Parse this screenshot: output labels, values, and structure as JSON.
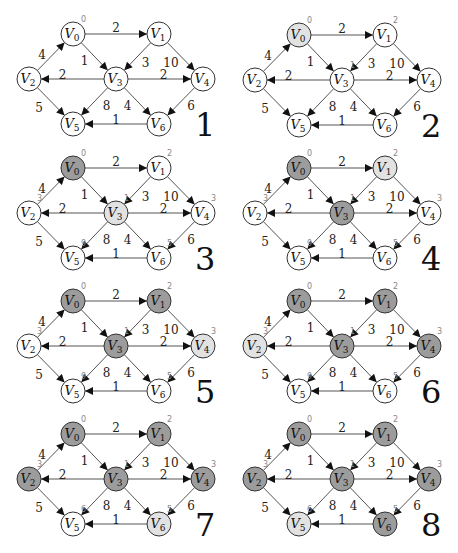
{
  "colors": {
    "unvisited": "#ffffff",
    "current": "#e2e2e2",
    "visited": "#9c9c9c"
  },
  "graph": {
    "nodes": [
      {
        "id": "V0",
        "name": "V",
        "sub": "0"
      },
      {
        "id": "V1",
        "name": "V",
        "sub": "1"
      },
      {
        "id": "V2",
        "name": "V",
        "sub": "2"
      },
      {
        "id": "V3",
        "name": "V",
        "sub": "3"
      },
      {
        "id": "V4",
        "name": "V",
        "sub": "4"
      },
      {
        "id": "V5",
        "name": "V",
        "sub": "5"
      },
      {
        "id": "V6",
        "name": "V",
        "sub": "6"
      }
    ],
    "edges": [
      {
        "from": "V0",
        "to": "V1",
        "weight": "2"
      },
      {
        "from": "V0",
        "to": "V3",
        "weight": "1"
      },
      {
        "from": "V2",
        "to": "V0",
        "weight": "4"
      },
      {
        "from": "V1",
        "to": "V3",
        "weight": "3"
      },
      {
        "from": "V1",
        "to": "V4",
        "weight": "10"
      },
      {
        "from": "V3",
        "to": "V2",
        "weight": "2"
      },
      {
        "from": "V3",
        "to": "V4",
        "weight": "2"
      },
      {
        "from": "V3",
        "to": "V5",
        "weight": "8"
      },
      {
        "from": "V3",
        "to": "V6",
        "weight": "4"
      },
      {
        "from": "V2",
        "to": "V5",
        "weight": "5"
      },
      {
        "from": "V4",
        "to": "V6",
        "weight": "6"
      },
      {
        "from": "V6",
        "to": "V5",
        "weight": "1"
      }
    ]
  },
  "steps": [
    {
      "label": "1",
      "state": {
        "V0": "unvisited",
        "V1": "unvisited",
        "V2": "unvisited",
        "V3": "unvisited",
        "V4": "unvisited",
        "V5": "unvisited",
        "V6": "unvisited"
      },
      "dist": {
        "V0": "0"
      }
    },
    {
      "label": "2",
      "state": {
        "V0": "current",
        "V1": "unvisited",
        "V2": "unvisited",
        "V3": "unvisited",
        "V4": "unvisited",
        "V5": "unvisited",
        "V6": "unvisited"
      },
      "dist": {
        "V0": "0",
        "V1": "2",
        "V3": "1"
      }
    },
    {
      "label": "3",
      "state": {
        "V0": "visited",
        "V1": "unvisited",
        "V2": "unvisited",
        "V3": "current",
        "V4": "unvisited",
        "V5": "unvisited",
        "V6": "unvisited"
      },
      "dist": {
        "V0": "0",
        "V1": "2",
        "V2": "3",
        "V3": "1",
        "V4": "3",
        "V5": "9",
        "V6": "5"
      }
    },
    {
      "label": "4",
      "state": {
        "V0": "visited",
        "V1": "current",
        "V2": "unvisited",
        "V3": "visited",
        "V4": "unvisited",
        "V5": "unvisited",
        "V6": "unvisited"
      },
      "dist": {
        "V0": "0",
        "V1": "2",
        "V2": "3",
        "V3": "1",
        "V4": "3",
        "V5": "9",
        "V6": "5"
      }
    },
    {
      "label": "5",
      "state": {
        "V0": "visited",
        "V1": "visited",
        "V2": "unvisited",
        "V3": "visited",
        "V4": "current",
        "V5": "unvisited",
        "V6": "unvisited"
      },
      "dist": {
        "V0": "0",
        "V1": "2",
        "V2": "3",
        "V3": "1",
        "V4": "3",
        "V5": "9",
        "V6": "5"
      }
    },
    {
      "label": "6",
      "state": {
        "V0": "visited",
        "V1": "visited",
        "V2": "current",
        "V3": "visited",
        "V4": "visited",
        "V5": "unvisited",
        "V6": "unvisited"
      },
      "dist": {
        "V0": "0",
        "V1": "2",
        "V2": "3",
        "V3": "1",
        "V4": "3",
        "V5": "9",
        "V6": "5"
      }
    },
    {
      "label": "7",
      "state": {
        "V0": "visited",
        "V1": "visited",
        "V2": "visited",
        "V3": "visited",
        "V4": "visited",
        "V5": "unvisited",
        "V6": "current"
      },
      "dist": {
        "V0": "0",
        "V1": "2",
        "V2": "3",
        "V3": "1",
        "V4": "3",
        "V5": "6",
        "V6": "5"
      }
    },
    {
      "label": "8",
      "state": {
        "V0": "visited",
        "V1": "visited",
        "V2": "visited",
        "V3": "visited",
        "V4": "visited",
        "V5": "current",
        "V6": "visited"
      },
      "dist": {
        "V0": "0",
        "V1": "2",
        "V2": "3",
        "V3": "1",
        "V4": "3",
        "V5": "6",
        "V6": "5"
      }
    }
  ]
}
